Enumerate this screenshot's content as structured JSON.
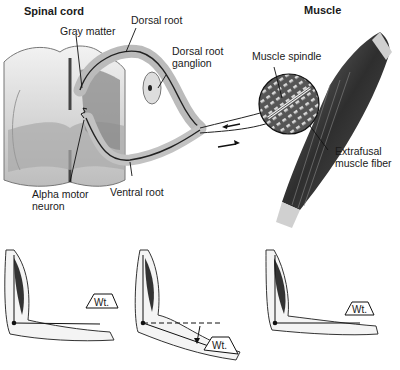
{
  "figure": {
    "top_panel": {
      "titles": {
        "spinal_cord": "Spinal cord",
        "muscle": "Muscle"
      },
      "labels": {
        "dorsal_root": "Dorsal root",
        "gray_matter": "Gray matter",
        "dorsal_root_ganglion_line1": "Dorsal root",
        "dorsal_root_ganglion_line2": "ganglion",
        "muscle_spindle": "Muscle spindle",
        "extrafusal_line1": "Extrafusal",
        "extrafusal_line2": "muscle fiber",
        "alpha_motor_line1": "Alpha motor",
        "alpha_motor_line2": "neuron",
        "ventral_root": "Ventral root"
      }
    },
    "bottom_panel": {
      "arms": [
        {
          "position": "left",
          "weight_label": "Wt.",
          "state": "arm flexed holding weight"
        },
        {
          "position": "middle",
          "weight_label": "Wt.",
          "state": "forearm drops under load (stretch)"
        },
        {
          "position": "right",
          "weight_label": "Wt.",
          "state": "reflex restores position"
        }
      ]
    },
    "colors": {
      "ink": "#1a1a1a",
      "gray_matter": "#8a8a8a",
      "white_matter": "#e6e6e6",
      "muscle_dark": "#3a3a3a",
      "background": "#ffffff"
    }
  }
}
